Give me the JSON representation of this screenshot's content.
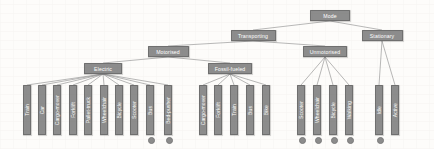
{
  "diagram": {
    "type": "tree",
    "title": "",
    "node_color": "#8c8c8c",
    "node_text_color": "#ffffff",
    "edge_color": "#9a9a9a",
    "background": "#fdfcfa",
    "dot_color": "#8c8c8c",
    "root": {
      "id": "mode",
      "label": "Mode",
      "x": 330,
      "y": 10,
      "w": 40
    },
    "level2": [
      {
        "id": "transporting",
        "label": "Transporting",
        "x": 253,
        "y": 30,
        "w": 45
      },
      {
        "id": "stationary",
        "label": "Stationary",
        "x": 382,
        "y": 30,
        "w": 41
      }
    ],
    "level3": [
      {
        "id": "motorised",
        "label": "Motorised",
        "x": 168,
        "y": 46,
        "w": 41
      },
      {
        "id": "unmotorised",
        "label": "Unmotorised",
        "x": 325,
        "y": 46,
        "w": 44
      }
    ],
    "level4": [
      {
        "id": "electric",
        "label": "Electric",
        "x": 103,
        "y": 63,
        "w": 38
      },
      {
        "id": "fossil-fueled",
        "label": "Fossil-fueled",
        "x": 230,
        "y": 63,
        "w": 44
      }
    ],
    "leaf_groups": [
      {
        "parent": "electric",
        "leaves": [
          {
            "label": "Train",
            "x": 27,
            "y": 85,
            "h": 50,
            "dot": false
          },
          {
            "label": "Car",
            "x": 42,
            "y": 85,
            "h": 50,
            "dot": false
          },
          {
            "label": "Cargo-mover",
            "x": 57,
            "y": 85,
            "h": 50,
            "dot": false
          },
          {
            "label": "Forklift",
            "x": 73,
            "y": 85,
            "h": 50,
            "dot": false
          },
          {
            "label": "Pallet-truck",
            "x": 88,
            "y": 85,
            "h": 50,
            "dot": false
          },
          {
            "label": "Wheelchair",
            "x": 104,
            "y": 85,
            "h": 50,
            "dot": false
          },
          {
            "label": "Bicycle",
            "x": 119,
            "y": 85,
            "h": 50,
            "dot": false
          },
          {
            "label": "Scooter",
            "x": 134,
            "y": 85,
            "h": 50,
            "dot": false
          },
          {
            "label": "Bus",
            "x": 150,
            "y": 85,
            "h": 50,
            "dot": true
          },
          {
            "label": "Bed-pusher",
            "x": 168,
            "y": 85,
            "h": 50,
            "dot": true
          }
        ]
      },
      {
        "parent": "fossil-fueled",
        "leaves": [
          {
            "label": "Cargo-mover",
            "x": 203,
            "y": 85,
            "h": 50,
            "dot": false
          },
          {
            "label": "Forklift",
            "x": 218,
            "y": 85,
            "h": 50,
            "dot": false
          },
          {
            "label": "Train",
            "x": 234,
            "y": 85,
            "h": 50,
            "dot": false
          },
          {
            "label": "Bus",
            "x": 250,
            "y": 85,
            "h": 50,
            "dot": false
          },
          {
            "label": "Bike",
            "x": 266,
            "y": 85,
            "h": 50,
            "dot": false
          }
        ]
      },
      {
        "parent": "unmotorised",
        "leaves": [
          {
            "label": "Scooter",
            "x": 301,
            "y": 85,
            "h": 50,
            "dot": true
          },
          {
            "label": "Wheelchair",
            "x": 317,
            "y": 85,
            "h": 50,
            "dot": true
          },
          {
            "label": "Bicycle",
            "x": 333,
            "y": 85,
            "h": 50,
            "dot": true
          },
          {
            "label": "Walking",
            "x": 349,
            "y": 85,
            "h": 50,
            "dot": true
          }
        ]
      },
      {
        "parent": "stationary",
        "leaves": [
          {
            "label": "Idle",
            "x": 379,
            "y": 85,
            "h": 50,
            "dot": true
          },
          {
            "label": "Active",
            "x": 395,
            "y": 85,
            "h": 50,
            "dot": false
          }
        ]
      }
    ]
  }
}
